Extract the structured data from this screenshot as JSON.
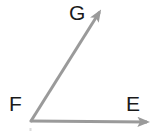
{
  "figure": {
    "kind": "geometry-angle-diagram",
    "background_color": "#ffffff",
    "width": 156,
    "height": 134,
    "stroke_color": "#9a9a9a",
    "label_color": "#1a1a1a",
    "stroke_width": 3,
    "vertex": {
      "name": "F",
      "x": 31,
      "y": 121
    },
    "labels": {
      "vertex": "F",
      "ray_horizontal_end": "E",
      "ray_diagonal_end": "G"
    },
    "rays": [
      {
        "name": "ray-FE",
        "from": "F",
        "to": "E",
        "start": {
          "x": 31,
          "y": 121
        },
        "end": {
          "x": 153,
          "y": 122
        },
        "arrowhead": "end",
        "direction": "right"
      },
      {
        "name": "ray-FG",
        "from": "F",
        "to": "G",
        "start": {
          "x": 31,
          "y": 121
        },
        "end": {
          "x": 104,
          "y": 5
        },
        "arrowhead": "end",
        "direction": "up-right"
      }
    ]
  }
}
